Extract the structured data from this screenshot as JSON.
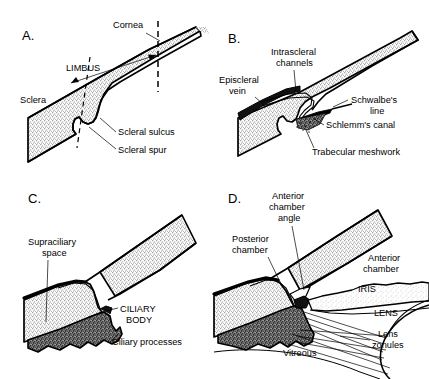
{
  "figure": {
    "background_color": "#ffffff",
    "ink_color": "#000000",
    "sclera_fill": "#d9d9d9",
    "ciliary_fill": "#6e6e6e",
    "iris_fill": "#e2e2e2"
  },
  "panels": [
    {
      "id": "A",
      "letter": "A.",
      "labels": [
        {
          "name": "cornea",
          "text": "Cornea"
        },
        {
          "name": "limbus",
          "text": "LIMBUS"
        },
        {
          "name": "sclera",
          "text": "Sclera"
        },
        {
          "name": "scleral-sulcus",
          "text": "Scleral sulcus"
        },
        {
          "name": "scleral-spur",
          "text": "Scleral spur"
        }
      ]
    },
    {
      "id": "B",
      "letter": "B.",
      "labels": [
        {
          "name": "intrascleral-channels-1",
          "text": "Intrascleral"
        },
        {
          "name": "intrascleral-channels-2",
          "text": "channels"
        },
        {
          "name": "episcleral-vein-1",
          "text": "Episcleral"
        },
        {
          "name": "episcleral-vein-2",
          "text": "vein"
        },
        {
          "name": "schwalbes-line-1",
          "text": "Schwalbe's"
        },
        {
          "name": "schwalbes-line-2",
          "text": "line"
        },
        {
          "name": "schlemms-canal",
          "text": "Schlemm's canal"
        },
        {
          "name": "trabecular-meshwork",
          "text": "Trabecular meshwork"
        }
      ]
    },
    {
      "id": "C",
      "letter": "C.",
      "labels": [
        {
          "name": "supraciliary-space-1",
          "text": "Supraciliary"
        },
        {
          "name": "supraciliary-space-2",
          "text": "space"
        },
        {
          "name": "ciliary-body-1",
          "text": "CILIARY"
        },
        {
          "name": "ciliary-body-2",
          "text": "BODY"
        },
        {
          "name": "ciliary-processes",
          "text": "Ciliary processes"
        }
      ]
    },
    {
      "id": "D",
      "letter": "D.",
      "labels": [
        {
          "name": "anterior-chamber-angle-1",
          "text": "Anterior"
        },
        {
          "name": "anterior-chamber-angle-2",
          "text": "chamber"
        },
        {
          "name": "anterior-chamber-angle-3",
          "text": "angle"
        },
        {
          "name": "posterior-chamber-1",
          "text": "Posterior"
        },
        {
          "name": "posterior-chamber-2",
          "text": "chamber"
        },
        {
          "name": "anterior-chamber-1",
          "text": "Anterior"
        },
        {
          "name": "anterior-chamber-2",
          "text": "chamber"
        },
        {
          "name": "iris",
          "text": "IRIS"
        },
        {
          "name": "lens",
          "text": "LENS"
        },
        {
          "name": "lens-zonules-1",
          "text": "Lens"
        },
        {
          "name": "lens-zonules-2",
          "text": "zonules"
        },
        {
          "name": "vitreous",
          "text": "Vitreous"
        }
      ]
    }
  ]
}
